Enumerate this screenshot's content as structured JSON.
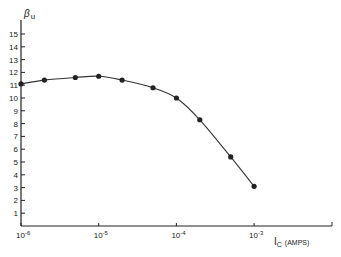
{
  "chart_data": {
    "type": "line",
    "title": "",
    "xlabel": "I_C (AMPS)",
    "ylabel": "β_u",
    "xscale": "log",
    "xlim": [
      1e-06,
      0.01
    ],
    "ylim": [
      0,
      16
    ],
    "x_ticks": [
      "10^-6",
      "10^-5",
      "10^-4",
      "10^-3"
    ],
    "y_ticks": [
      1,
      2,
      3,
      4,
      5,
      6,
      7,
      8,
      9,
      10,
      11,
      12,
      13,
      14,
      15
    ],
    "grid": false,
    "legend": null,
    "series": [
      {
        "name": "β_u vs I_C",
        "x": [
          1e-06,
          2e-06,
          5e-06,
          1e-05,
          2e-05,
          5e-05,
          0.0001,
          0.0002,
          0.0005,
          0.001
        ],
        "values": [
          11.1,
          11.4,
          11.6,
          11.7,
          11.4,
          10.8,
          10.0,
          8.3,
          5.4,
          3.1
        ]
      }
    ]
  },
  "labels": {
    "y_axis_symbol": "β",
    "y_axis_sub": "u",
    "x_axis_symbol": "I",
    "x_axis_sub": "C",
    "x_axis_unit": "(AMPS)",
    "x_tick_base": "10",
    "x_tick_exps": [
      "-6",
      "-5",
      "-4",
      "-3"
    ]
  }
}
